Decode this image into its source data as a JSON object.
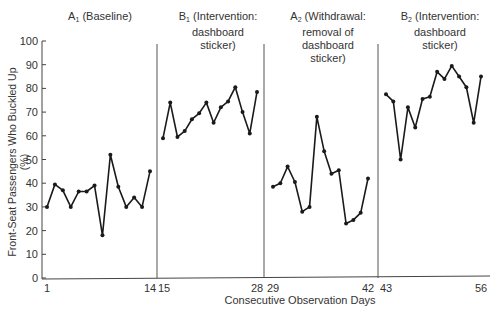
{
  "chart_data": {
    "type": "line",
    "title": "",
    "xlabel": "Consecutive Observation Days",
    "ylabel": "Front-Seat Passengers Who Buckled Up (%)",
    "ylim": [
      0,
      100
    ],
    "yticks": [
      0,
      10,
      20,
      30,
      40,
      50,
      60,
      70,
      80,
      90,
      100
    ],
    "xticks": [
      1,
      14,
      15,
      28,
      29,
      42,
      43,
      56
    ],
    "grid": false,
    "legend": null,
    "phase_dividers_after_day": [
      14,
      28,
      42
    ],
    "series": [
      {
        "name": "A1 (Baseline)",
        "phase_base": "A",
        "phase_sub": "1",
        "phase_text": "(Baseline)",
        "x": [
          1,
          2,
          3,
          4,
          5,
          6,
          7,
          8,
          9,
          10,
          11,
          12,
          13,
          14
        ],
        "values": [
          30,
          39.5,
          37,
          30,
          36.5,
          36.5,
          39,
          18,
          52,
          38.5,
          30,
          34,
          30,
          45
        ]
      },
      {
        "name": "B1 (Intervention: dashboard sticker)",
        "phase_base": "B",
        "phase_sub": "1",
        "phase_text": "(Intervention: dashboard sticker)",
        "x": [
          15,
          16,
          17,
          18,
          19,
          20,
          21,
          22,
          23,
          24,
          25,
          26,
          27,
          28
        ],
        "values": [
          59,
          74,
          59.5,
          62,
          67,
          69.5,
          74,
          65.5,
          72,
          74.5,
          80.5,
          70,
          61,
          78.5
        ]
      },
      {
        "name": "A2 (Withdrawal: removal of dashboard sticker)",
        "phase_base": "A",
        "phase_sub": "2",
        "phase_text": "(Withdrawal: removal of dashboard sticker)",
        "x": [
          29,
          30,
          31,
          32,
          33,
          34,
          35,
          36,
          37,
          38,
          39,
          40,
          41,
          42
        ],
        "values": [
          38.5,
          40,
          47,
          40.5,
          28,
          30,
          68,
          53.5,
          44,
          45.5,
          23,
          24.5,
          27.5,
          42
        ]
      },
      {
        "name": "B2 (Intervention: dashboard sticker)",
        "phase_base": "B",
        "phase_sub": "2",
        "phase_text": "(Intervention: dashboard sticker)",
        "x": [
          43,
          44,
          45,
          46,
          47,
          48,
          49,
          50,
          51,
          52,
          53,
          54,
          55,
          56
        ],
        "values": [
          77.5,
          74.5,
          50,
          72,
          63.5,
          75.5,
          76.5,
          87,
          84,
          89.5,
          85,
          80.5,
          65.5,
          85
        ]
      }
    ]
  },
  "labels": {
    "phase_a1_base": "A",
    "phase_a1_sub": "1",
    "phase_a1_line1": "(Baseline)",
    "phase_b1_base": "B",
    "phase_b1_sub": "1",
    "phase_b1_line1": "(Intervention:",
    "phase_b1_line2": "dashboard",
    "phase_b1_line3": "sticker)",
    "phase_a2_base": "A",
    "phase_a2_sub": "2",
    "phase_a2_line1": "(Withdrawal:",
    "phase_a2_line2": "removal of",
    "phase_a2_line3": "dashboard",
    "phase_a2_line4": "sticker)",
    "phase_b2_base": "B",
    "phase_b2_sub": "2",
    "phase_b2_line1": "(Intervention:",
    "phase_b2_line2": "dashboard",
    "phase_b2_line3": "sticker)",
    "xlabel": "Consecutive Observation Days",
    "ylabel": "Front-Seat Passengers Who Buckled Up (%)"
  },
  "colors": {
    "line": "#1a1a1a",
    "axis": "#444444",
    "divider": "#555555",
    "text": "#333333"
  }
}
